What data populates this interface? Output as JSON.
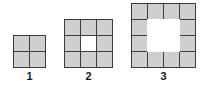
{
  "diagram": {
    "type": "growing-square-ring-pattern",
    "background_color": "#ffffff",
    "cell_fill_color": "#cfcfcf",
    "hole_color": "#ffffff",
    "line_color": "#3c3c3c",
    "label_color": "#1a1a1a",
    "figures": [
      {
        "label": "1",
        "grid_size": 2,
        "cell_count": 4,
        "hole_size": 0,
        "cells": [
          [
            "filled",
            "filled"
          ],
          [
            "filled",
            "filled"
          ]
        ]
      },
      {
        "label": "2",
        "grid_size": 3,
        "cell_count": 8,
        "hole_size": 1,
        "cells": [
          [
            "filled",
            "filled",
            "filled"
          ],
          [
            "filled",
            "empty",
            "filled"
          ],
          [
            "filled",
            "filled",
            "filled"
          ]
        ]
      },
      {
        "label": "3",
        "grid_size": 4,
        "cell_count": 12,
        "hole_size": 2,
        "cells": [
          [
            "filled",
            "filled",
            "filled",
            "filled"
          ],
          [
            "filled",
            "empty",
            "empty",
            "filled"
          ],
          [
            "filled",
            "empty",
            "empty",
            "filled"
          ],
          [
            "filled",
            "filled",
            "filled",
            "filled"
          ]
        ]
      }
    ]
  }
}
